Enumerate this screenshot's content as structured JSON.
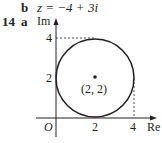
{
  "part_b": {
    "letter": "b",
    "equation": "z = −4 + 3i"
  },
  "question": {
    "number": "14",
    "letter": "a"
  },
  "diagram": {
    "y_axis_label": "Im",
    "x_axis_label": "Re",
    "origin_label": "O",
    "y_ticks": [
      "4",
      "2"
    ],
    "x_ticks": [
      "2",
      "4"
    ],
    "center_label": "(2, 2)",
    "circle": {
      "center": [
        2,
        2
      ],
      "radius": 2
    }
  }
}
